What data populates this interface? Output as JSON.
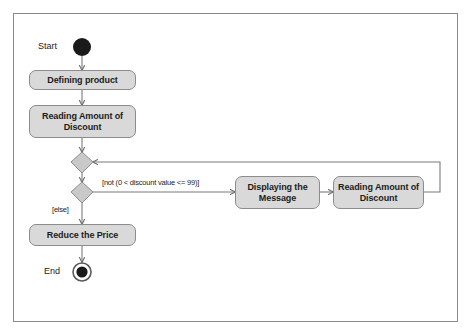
{
  "diagram": {
    "type": "uml-activity-diagram",
    "frame": {
      "present": true
    },
    "colors": {
      "node_fill": "#d9d9d9",
      "node_border": "#8c8c8c",
      "diamond_fill": "#c9c9c9",
      "edge": "#7a7a7a",
      "frame_border": "#8a8a8a",
      "text": "#1c1c1c",
      "background": "#ffffff",
      "terminal_fill": "#1a1a1a"
    },
    "nodes": {
      "start_label": "Start",
      "end_label": "End",
      "defining_product": "Defining product",
      "reading_amount_1": "Reading Amount of Discount",
      "reading_amount_2": "Reading Amount of Discount",
      "displaying_message": "Displaying the Message",
      "reduce_price": "Reduce the Price"
    },
    "guards": {
      "not_valid": "[not (0 < discount value <= 99)]",
      "else": "[else]"
    }
  }
}
